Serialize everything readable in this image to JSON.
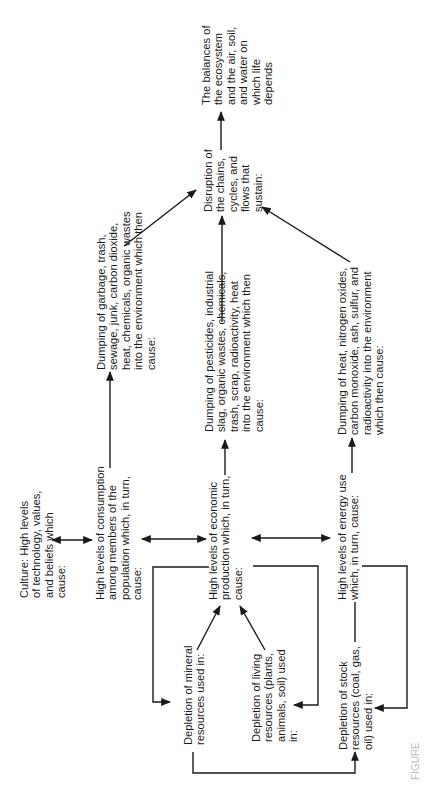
{
  "diagram": {
    "orientation": "rotated -90 degrees (text reads bottom to top)",
    "nodes": {
      "balances": "The balances of\nthe ecosystem\nand the air, soil,\nand water on\nwhich life depends",
      "disruption": "Disruption of\nthe chains,\ncycles, and\nflows that\nsustain:",
      "dump_garbage": "Dumping of garbage, trash,\nsewage, junk, carbon dioxide,\nheat, chemicals, organic wastes\ninto the environment which then cause:",
      "dump_pesticides": "Dumping of pesticides, industrial\nslag, organic wastes, chemicals,\ntrash, scrap, radioactivity, heat\ninto the environment which then\ncause:",
      "dump_heat": "Dumping of heat, nitrogen oxides,\ncarbon monoxide, ash, sulfur, and\nradioactivity into the environment\nwhich then cause:",
      "culture": "Culture: High levels\nof technology, values,\nand beliefs which cause:",
      "consumption": "High levels of consumption\namong members of the\npopulation which, in turn,\ncause:",
      "production": "High levels of economic\nproduction which, in turn,\ncause:",
      "energy": "High levels of energy use\nwhich, in turn, cause:",
      "mineral": "Depletion of mineral\nresources used in:",
      "living": "Depletion of living\nresources (plants,\nanimals, soil) used\nin:",
      "stock": "Depletion of stock\nresources (coal, gas,\noil) used in:"
    },
    "edges": [
      {
        "from": "disruption",
        "to": "balances",
        "type": "arrow"
      },
      {
        "from": "dump_garbage",
        "to": "disruption",
        "type": "arrow"
      },
      {
        "from": "dump_pesticides",
        "to": "disruption",
        "type": "arrow"
      },
      {
        "from": "dump_heat",
        "to": "disruption",
        "type": "arrow"
      },
      {
        "from": "consumption",
        "to": "dump_garbage",
        "type": "arrow"
      },
      {
        "from": "production",
        "to": "dump_pesticides",
        "type": "arrow"
      },
      {
        "from": "energy",
        "to": "dump_heat",
        "type": "arrow"
      },
      {
        "from": "culture",
        "to": "consumption",
        "type": "double-arrow"
      },
      {
        "from": "consumption",
        "to": "production",
        "type": "double-arrow"
      },
      {
        "from": "production",
        "to": "energy",
        "type": "double-arrow"
      },
      {
        "from": "mineral",
        "to": "production",
        "type": "arrow"
      },
      {
        "from": "living",
        "to": "production",
        "type": "arrow"
      },
      {
        "from": "production",
        "to": "mineral",
        "type": "elbow-arrow"
      },
      {
        "from": "production",
        "to": "living",
        "type": "elbow-arrow"
      },
      {
        "from": "energy",
        "to": "stock",
        "type": "elbow-arrow"
      },
      {
        "from": "mineral",
        "to": "stock",
        "type": "elbow-arrow"
      },
      {
        "from": "stock",
        "to": "energy",
        "type": "line"
      }
    ],
    "caption": "FIGURE"
  },
  "colors": {
    "ink": "#1a1a1a",
    "background": "#ffffff",
    "caption": "#bdbdbd"
  }
}
